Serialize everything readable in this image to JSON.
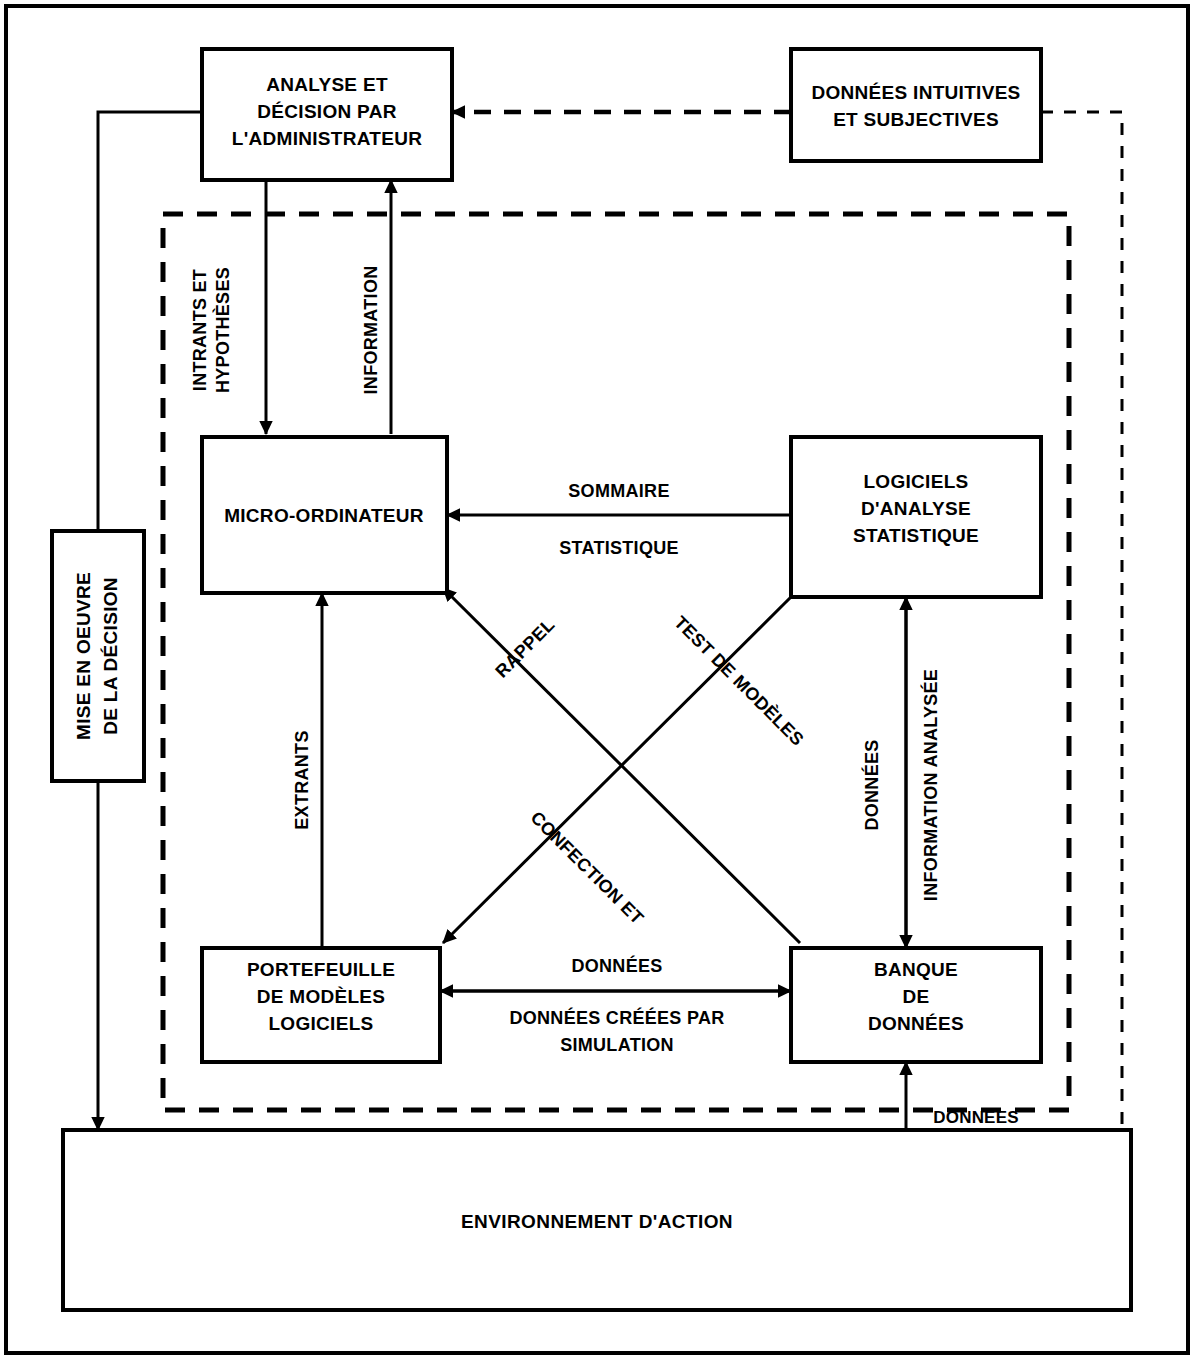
{
  "diagram": {
    "boxes": {
      "admin": {
        "lines": [
          "ANALYSE ET",
          "DÉCISION PAR",
          "L'ADMINISTRATEUR"
        ]
      },
      "intuitive": {
        "lines": [
          "DONNÉES INTUITIVES",
          "ET SUBJECTIVES"
        ]
      },
      "micro": {
        "lines": [
          "MICRO-ORDINATEUR"
        ]
      },
      "stats": {
        "lines": [
          "LOGICIELS",
          "D'ANALYSE",
          "STATISTIQUE"
        ]
      },
      "models": {
        "lines": [
          "PORTEFEUILLE",
          "DE MODÈLES",
          "LOGICIELS"
        ]
      },
      "databank": {
        "lines": [
          "BANQUE",
          "DE",
          "DONNÉES"
        ]
      },
      "decision": {
        "lines": [
          "MISE EN OEUVRE",
          "DE LA DÉCISION"
        ]
      },
      "environment": {
        "lines": [
          "ENVIRONNEMENT D'ACTION"
        ]
      }
    },
    "edge_labels": {
      "inputs_hypotheses": [
        "INTRANTS ET",
        "HYPOTHÈSES"
      ],
      "information": [
        "INFORMATION"
      ],
      "summary_stat": [
        "SOMMAIRE",
        "STATISTIQUE"
      ],
      "recall": [
        "RAPPEL"
      ],
      "model_test": [
        "TEST DE MODÈLES"
      ],
      "creation": [
        "CONFECTION ET"
      ],
      "outputs": [
        "EXTRANTS"
      ],
      "data_vertical": [
        "DONNÉES"
      ],
      "analysed_information": [
        "INFORMATION ANALYSÉE"
      ],
      "data_horizontal": [
        "DONNÉES"
      ],
      "simulated_data": [
        "DONNÉES CRÉÉES PAR",
        "SIMULATION"
      ],
      "data_bottom": [
        "DONNÉES"
      ]
    },
    "colors": {
      "stroke": "#000000",
      "fill": "#ffffff",
      "background": "#ffffff"
    }
  }
}
